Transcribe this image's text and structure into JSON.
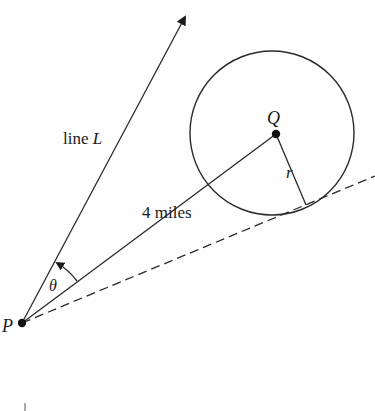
{
  "diagram": {
    "labels": {
      "line": "line ",
      "line_var": "L",
      "distance": "4 miles",
      "center": "Q",
      "radius": "r",
      "angle": "θ",
      "point": "P"
    },
    "colors": {
      "stroke": "#2a2a2a",
      "text": "#1a1a1a"
    },
    "geometry": {
      "P": [
        22,
        323
      ],
      "Q": [
        276,
        134
      ],
      "circle_center": [
        272,
        133
      ],
      "circle_radius": 83,
      "tangent_point": [
        307,
        205
      ],
      "line_L_tip": [
        187,
        13
      ]
    }
  }
}
